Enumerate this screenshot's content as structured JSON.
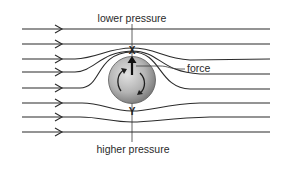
{
  "diagram": {
    "labels": {
      "top": "lower pressure",
      "bottom": "higher pressure",
      "force": "force",
      "point_top": "X",
      "point_bottom": "Y"
    },
    "colors": {
      "line": "#2b2b2b",
      "ball_light": "#d9d9d9",
      "ball_dark": "#7a7a7a",
      "background": "#ffffff"
    },
    "streamline_count": 8,
    "ball": {
      "spin": "clockwise-arrows",
      "force_direction": "up"
    }
  }
}
